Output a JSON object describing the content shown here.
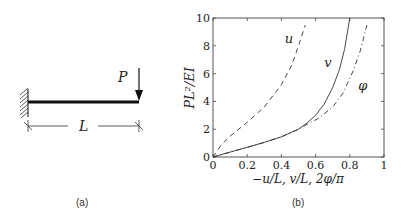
{
  "diagram_a": {
    "caption": "(a)",
    "load_label": "P",
    "length_label": "L",
    "support": "fixed-wall"
  },
  "diagram_b": {
    "caption": "(b)"
  },
  "chart_data": {
    "type": "line",
    "title": "",
    "xlabel": "−u/L, v/L, 2φ/π",
    "ylabel": "PL²/EI",
    "xlim": [
      0,
      1
    ],
    "ylim": [
      0,
      10
    ],
    "xticks": [
      "0",
      "0.2",
      "0.4",
      "0.6",
      "0.8",
      "1"
    ],
    "yticks": [
      "0",
      "2",
      "4",
      "6",
      "8",
      "10"
    ],
    "grid": false,
    "legend": "inline labels",
    "series": [
      {
        "name": "u",
        "style": "dashed",
        "x": [
          0,
          0.05,
          0.1,
          0.2,
          0.3,
          0.4,
          0.46,
          0.5,
          0.54
        ],
        "y": [
          0,
          0.9,
          1.5,
          2.5,
          3.6,
          5.2,
          6.6,
          8.0,
          9.5
        ]
      },
      {
        "name": "v",
        "style": "solid",
        "x": [
          0,
          0.1,
          0.2,
          0.3,
          0.4,
          0.5,
          0.55,
          0.6,
          0.65,
          0.7,
          0.74,
          0.77,
          0.8
        ],
        "y": [
          0,
          0.35,
          0.7,
          1.05,
          1.45,
          2.0,
          2.45,
          3.0,
          3.8,
          5.0,
          6.3,
          7.8,
          10.0
        ]
      },
      {
        "name": "φ",
        "style": "dash-dot",
        "x": [
          0,
          0.1,
          0.2,
          0.3,
          0.4,
          0.5,
          0.55,
          0.62,
          0.7,
          0.76,
          0.82,
          0.86,
          0.9
        ],
        "y": [
          0,
          0.35,
          0.7,
          1.05,
          1.45,
          2.0,
          2.35,
          2.8,
          3.6,
          4.6,
          6.2,
          7.6,
          9.5
        ]
      }
    ],
    "annotations": [
      {
        "text": "u",
        "x": 0.42,
        "y": 8.2
      },
      {
        "text": "v",
        "x": 0.65,
        "y": 6.5
      },
      {
        "text": "φ",
        "x": 0.85,
        "y": 4.8
      }
    ]
  }
}
